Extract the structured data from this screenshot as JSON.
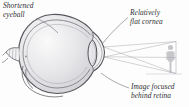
{
  "figure": {
    "background_color": "#fdfdfd",
    "ink_color": "#2e2e33",
    "sclera_outline_color": "#4a4a50",
    "interior_shade_color": "#dcdcdf",
    "ray_color": "#9a9aa0",
    "figure_person_color": "#c9c9cd"
  },
  "labels": {
    "shortened_eyeball": {
      "line1": "Shortened",
      "line2": "eyeball"
    },
    "flat_cornea": {
      "line1": "Relatively",
      "line2": "flat cornea"
    },
    "image_focused": {
      "line1": "Image focused",
      "line2": "behind retina"
    }
  },
  "parts": {
    "eyeball": "eyeball-cross-section",
    "cornea": "cornea-arc",
    "lens": "lens",
    "optic_nerve": "optic-nerve",
    "retina": "retina-wall",
    "object": "object-person-silhouette",
    "rays": "light-ray-lines",
    "focal_point": "focal-point-behind-retina"
  }
}
